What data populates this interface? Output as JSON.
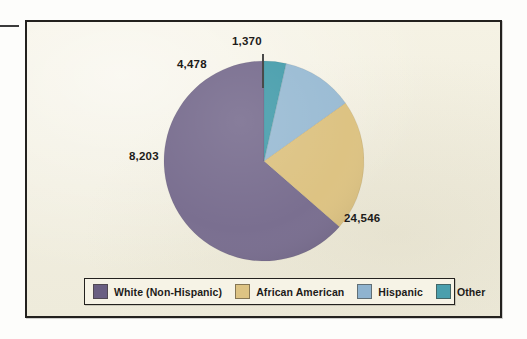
{
  "figure": {
    "background_color": "#f3f0e1",
    "frame_color": "#23211e"
  },
  "chart_data": {
    "type": "pie",
    "title": "",
    "subtitle": "",
    "xlabel": "",
    "ylabel": "",
    "total": 38597,
    "legend_position": "bottom",
    "grid": false,
    "start_angle_deg": 0,
    "direction": "counterclockwise",
    "categories": [
      "White (Non-Hispanic)",
      "African American",
      "Hispanic",
      "Other"
    ],
    "values": [
      24546,
      8203,
      4478,
      1370
    ],
    "value_labels": [
      "24,546",
      "8,203",
      "4,478",
      "1,370"
    ],
    "colors": [
      "#7a6f90",
      "#ddc383",
      "#9bbcd4",
      "#4a9fad"
    ],
    "slices": [
      {
        "label": "White (Non-Hispanic)",
        "value": 24546,
        "value_label": "24,546",
        "percent": 63.6,
        "color": "#7a6f90",
        "start_angle_deg": 0,
        "end_angle_deg": 228.98
      },
      {
        "label": "African American",
        "value": 8203,
        "value_label": "8,203",
        "percent": 21.3,
        "color": "#ddc383",
        "start_angle_deg": 228.98,
        "end_angle_deg": 305.5
      },
      {
        "label": "Hispanic",
        "value": 4478,
        "value_label": "4,478",
        "percent": 11.6,
        "color": "#9bbcd4",
        "start_angle_deg": 305.5,
        "end_angle_deg": 347.22
      },
      {
        "label": "Other",
        "value": 1370,
        "value_label": "1,370",
        "percent": 3.5,
        "color": "#4a9fad",
        "start_angle_deg": 347.22,
        "end_angle_deg": 360.0
      }
    ]
  },
  "legend": {
    "items": [
      {
        "label": "White (Non-Hispanic)",
        "color": "#6a5f82"
      },
      {
        "label": "African American",
        "color": "#ddc383"
      },
      {
        "label": "Hispanic",
        "color": "#8fb3cf"
      },
      {
        "label": "Other",
        "color": "#4a9fad"
      }
    ]
  },
  "annotations": {
    "leader_line_for": "Other"
  }
}
